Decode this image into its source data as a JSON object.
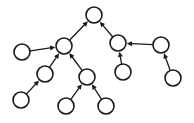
{
  "figure": {
    "name": "directed-graph-tree",
    "background_color": "#ffffff",
    "width": 194,
    "height": 123,
    "node_fill": "#ffffff",
    "node_stroke": "#1a1a1a",
    "node_stroke_width": 1.6,
    "node_radius": 8,
    "edge_stroke": "#1a1a1a",
    "edge_stroke_width": 1.3,
    "arrowhead": "filled-triangle"
  },
  "chart_data": {
    "type": "diagram",
    "diagram_type": "directed-graph",
    "title": "",
    "xlabel": "",
    "ylabel": "",
    "directed": true,
    "node_count": 11,
    "edge_count": 10,
    "nodes": [
      {
        "id": "n0",
        "label": "",
        "x": 94,
        "y": 15,
        "role": "root"
      },
      {
        "id": "n1",
        "label": "",
        "x": 64,
        "y": 46,
        "role": "hub"
      },
      {
        "id": "n2",
        "label": "",
        "x": 118,
        "y": 43,
        "role": "internal"
      },
      {
        "id": "n3",
        "label": "",
        "x": 22,
        "y": 52,
        "role": "leaf"
      },
      {
        "id": "n4",
        "label": "",
        "x": 45,
        "y": 74,
        "role": "internal"
      },
      {
        "id": "n5",
        "label": "",
        "x": 87,
        "y": 77,
        "role": "internal"
      },
      {
        "id": "n6",
        "label": "",
        "x": 123,
        "y": 72,
        "role": "leaf"
      },
      {
        "id": "n7",
        "label": "",
        "x": 161,
        "y": 45,
        "role": "internal"
      },
      {
        "id": "n8",
        "label": "",
        "x": 21,
        "y": 100,
        "role": "leaf"
      },
      {
        "id": "n9",
        "label": "",
        "x": 66,
        "y": 106,
        "role": "leaf"
      },
      {
        "id": "n10",
        "label": "",
        "x": 106,
        "y": 106,
        "role": "leaf"
      },
      {
        "id": "n11",
        "label": "",
        "x": 173,
        "y": 78,
        "role": "leaf"
      }
    ],
    "edges": [
      {
        "from": "n1",
        "to": "n0",
        "arrow": "to"
      },
      {
        "from": "n2",
        "to": "n0",
        "arrow": "to"
      },
      {
        "from": "n3",
        "to": "n1",
        "arrow": "to"
      },
      {
        "from": "n4",
        "to": "n1",
        "arrow": "to"
      },
      {
        "from": "n5",
        "to": "n1",
        "arrow": "to"
      },
      {
        "from": "n8",
        "to": "n4",
        "arrow": "to"
      },
      {
        "from": "n9",
        "to": "n5",
        "arrow": "to"
      },
      {
        "from": "n10",
        "to": "n5",
        "arrow": "to"
      },
      {
        "from": "n6",
        "to": "n2",
        "arrow": "to"
      },
      {
        "from": "n7",
        "to": "n2",
        "arrow": "to"
      },
      {
        "from": "n11",
        "to": "n7",
        "arrow": "to"
      }
    ]
  }
}
